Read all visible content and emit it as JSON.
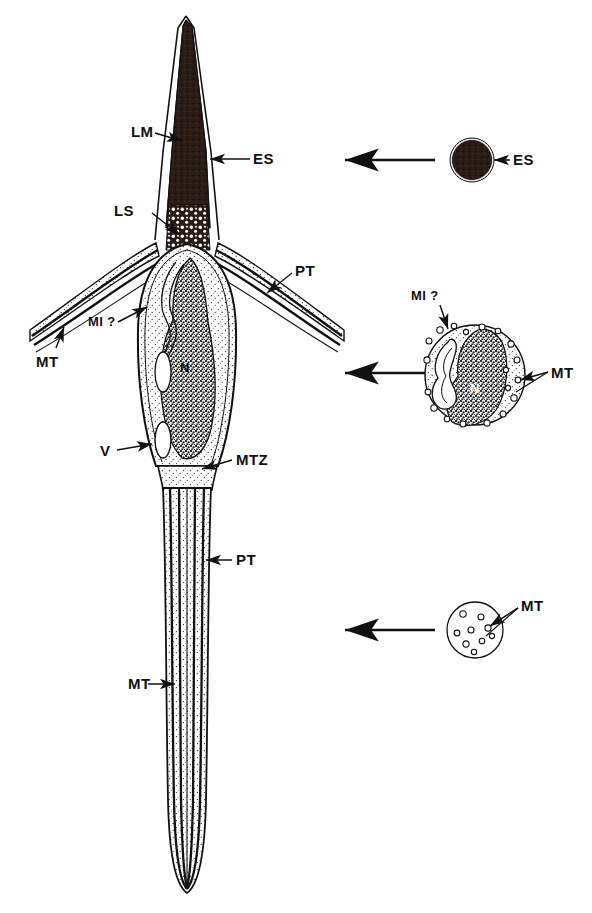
{
  "figure": {
    "background_color": "#ffffff",
    "ink_color": "#111111",
    "dark_fill_color": "#2b1d16",
    "nucleus_fill_color": "#3a3a3a"
  },
  "labels": {
    "lm": "LM",
    "es_main": "ES",
    "ls": "LS",
    "pt_top": "PT",
    "mt_left": "MT",
    "mi_main": "MI ?",
    "v": "V",
    "mtz": "MTZ",
    "pt_tail": "PT",
    "mt_tail": "MT",
    "es_section": "ES",
    "mi_section": "MI ?",
    "mt_section_mid": "MT",
    "mt_section_bottom": "MT",
    "nucleus": "N"
  },
  "sections": [
    {
      "id": "section-acrosome",
      "name": "acrosomal-cross-section",
      "label": "ES",
      "description": "solid dark stippled disc"
    },
    {
      "id": "section-nucleus",
      "name": "nuclear-cross-section",
      "label_nucleus": "N",
      "label_mitochondrion": "MI ?",
      "label_microtubules": "MT",
      "description": "circle containing kidney shaped stippled nucleus, a looped mitochondrion and peripheral microtubules"
    },
    {
      "id": "section-tail",
      "name": "tail-cross-section",
      "label": "MT",
      "description": "small circle with scattered microtubule profiles"
    }
  ],
  "connectors": [
    {
      "name": "connector-acrosome",
      "direction": "left"
    },
    {
      "name": "connector-nucleus",
      "direction": "left"
    },
    {
      "name": "connector-tail",
      "direction": "left"
    }
  ]
}
